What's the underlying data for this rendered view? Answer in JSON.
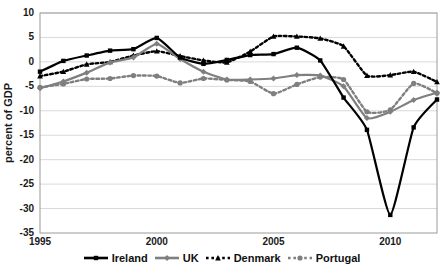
{
  "chart_data": {
    "type": "line",
    "title": "",
    "xlabel": "",
    "ylabel": "percent of GDP",
    "xlim": [
      1995,
      2012
    ],
    "ylim": [
      -35,
      10
    ],
    "ytick_values": [
      10,
      5,
      0,
      -5,
      -10,
      -15,
      -20,
      -25,
      -30,
      -35
    ],
    "ytick_labels": [
      "10",
      "5",
      "0",
      "-5",
      "-10",
      "-15",
      "-20",
      "-25",
      "-30",
      "-35"
    ],
    "xtick_values": [
      1995,
      2000,
      2005,
      2010
    ],
    "xtick_labels": [
      "1995",
      "2000",
      "2005",
      "2010"
    ],
    "grid": "horizontal",
    "legend_position": "bottom",
    "x": [
      1995,
      1996,
      1997,
      1998,
      1999,
      2000,
      2001,
      2002,
      2003,
      2004,
      2005,
      2006,
      2007,
      2008,
      2009,
      2010,
      2011,
      2012
    ],
    "series": [
      {
        "name": "Ireland",
        "color": "#000000",
        "style": "solid",
        "marker": "square",
        "values": [
          -2.0,
          0.2,
          1.3,
          2.3,
          2.6,
          4.9,
          0.9,
          -0.4,
          0.4,
          1.4,
          1.6,
          2.9,
          0.3,
          -7.3,
          -13.9,
          -31.3,
          -13.4,
          -7.7
        ]
      },
      {
        "name": "UK",
        "color": "#7f7f7f",
        "style": "solid",
        "marker": "diamond",
        "values": [
          -5.4,
          -4.0,
          -2.2,
          -0.1,
          0.9,
          3.7,
          0.6,
          -2.0,
          -3.6,
          -3.6,
          -3.4,
          -2.7,
          -2.8,
          -5.0,
          -11.5,
          -10.2,
          -7.8,
          -6.3
        ]
      },
      {
        "name": "Denmark",
        "color": "#000000",
        "style": "dotted",
        "marker": "triangle",
        "values": [
          -2.9,
          -2.0,
          -0.5,
          0.0,
          1.3,
          2.2,
          1.2,
          0.3,
          -0.1,
          2.1,
          5.2,
          5.2,
          4.8,
          3.2,
          -2.8,
          -2.7,
          -2.0,
          -4.1
        ]
      },
      {
        "name": "Portugal",
        "color": "#7f7f7f",
        "style": "dotted",
        "marker": "circle",
        "values": [
          -5.2,
          -4.5,
          -3.5,
          -3.4,
          -2.8,
          -2.9,
          -4.3,
          -3.4,
          -3.7,
          -4.0,
          -6.5,
          -4.6,
          -3.1,
          -3.6,
          -10.2,
          -9.8,
          -4.4,
          -6.4
        ]
      }
    ]
  },
  "axes": {
    "ylabel": "percent of GDP"
  },
  "legend": {
    "items": [
      {
        "label": "Ireland"
      },
      {
        "label": "UK"
      },
      {
        "label": "Denmark"
      },
      {
        "label": "Portugal"
      }
    ]
  }
}
